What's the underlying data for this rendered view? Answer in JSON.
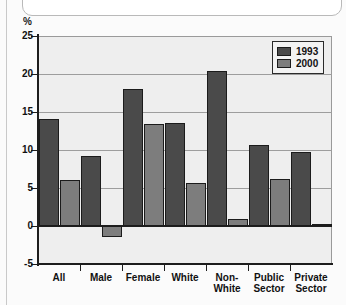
{
  "chart_data": {
    "type": "bar",
    "title": "",
    "subtitle": "",
    "xlabel": "",
    "ylabel": "%",
    "ylim": [
      -5,
      25
    ],
    "yticks": [
      -5,
      0,
      5,
      10,
      15,
      20,
      25
    ],
    "ytick_labels": [
      "-5",
      "0",
      "5",
      "10",
      "15",
      "20",
      "25"
    ],
    "grid": true,
    "grid_axis": "y",
    "legend_position": "top-right-inside",
    "categories": [
      "All",
      "Male",
      "Female",
      "White",
      "Non-White",
      "Public Sector",
      "Private Sector"
    ],
    "category_lines": [
      [
        "All"
      ],
      [
        "Male"
      ],
      [
        "Female"
      ],
      [
        "White"
      ],
      [
        "Non-",
        "White"
      ],
      [
        "Public",
        "Sector"
      ],
      [
        "Private",
        "Sector"
      ]
    ],
    "series": [
      {
        "name": "1993",
        "color": "#4a4a4a",
        "values": [
          14.1,
          9.2,
          18.0,
          13.5,
          20.4,
          10.7,
          9.8
        ]
      },
      {
        "name": "2000",
        "color": "#7d7d7d",
        "values": [
          6.1,
          -1.5,
          13.4,
          5.7,
          0.9,
          6.2,
          0.3
        ]
      }
    ]
  },
  "colors": {
    "series_1993": "#4a4a4a",
    "series_2000": "#7d7d7d",
    "plot_background": "#eeeeee",
    "page_background": "#fbfbfb",
    "axis": "#1d1d1d",
    "gridline": "#9d9d9d"
  }
}
